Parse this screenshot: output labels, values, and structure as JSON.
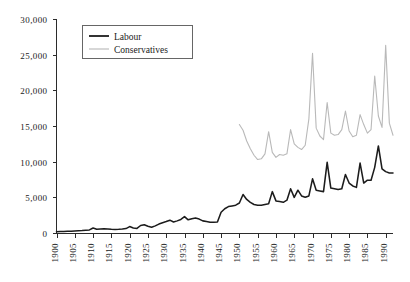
{
  "chart_data": {
    "type": "line",
    "title": "",
    "subtitle": "",
    "xlabel": "",
    "ylabel": "",
    "xlim": [
      1900,
      1992
    ],
    "ylim": [
      0,
      30000
    ],
    "grid": false,
    "legend_position": "top-left-inside",
    "y_ticks": [
      0,
      5000,
      10000,
      15000,
      20000,
      25000,
      30000
    ],
    "y_tick_labels": [
      "0",
      "5,000",
      "10,000",
      "15,000",
      "20,000",
      "25,000",
      "30,000"
    ],
    "x_ticks": [
      1900,
      1905,
      1910,
      1915,
      1920,
      1925,
      1930,
      1935,
      1940,
      1945,
      1950,
      1955,
      1960,
      1965,
      1970,
      1975,
      1980,
      1985,
      1990
    ],
    "x_tick_labels": [
      "1900",
      "1905",
      "1910",
      "1915",
      "1920",
      "1925",
      "1930",
      "1935",
      "1940",
      "1945",
      "1950",
      "1955",
      "1960",
      "1965",
      "1970",
      "1975",
      "1980",
      "1985",
      "1990"
    ],
    "series": [
      {
        "name": "Labour",
        "color": "#1c1c1c",
        "x": [
          1900,
          1901,
          1902,
          1903,
          1904,
          1905,
          1906,
          1907,
          1908,
          1909,
          1910,
          1911,
          1912,
          1913,
          1914,
          1915,
          1916,
          1917,
          1918,
          1919,
          1920,
          1921,
          1922,
          1923,
          1924,
          1925,
          1926,
          1927,
          1928,
          1929,
          1930,
          1931,
          1932,
          1933,
          1934,
          1935,
          1936,
          1937,
          1938,
          1939,
          1940,
          1941,
          1942,
          1943,
          1944,
          1945,
          1946,
          1947,
          1948,
          1949,
          1950,
          1951,
          1952,
          1953,
          1954,
          1955,
          1956,
          1957,
          1958,
          1959,
          1960,
          1961,
          1962,
          1963,
          1964,
          1965,
          1966,
          1967,
          1968,
          1969,
          1970,
          1971,
          1972,
          1973,
          1974,
          1975,
          1976,
          1977,
          1978,
          1979,
          1980,
          1981,
          1982,
          1983,
          1984,
          1985,
          1986,
          1987,
          1988,
          1989,
          1990,
          1991,
          1992
        ],
        "values": [
          180,
          200,
          210,
          240,
          260,
          290,
          320,
          350,
          400,
          430,
          700,
          520,
          560,
          600,
          560,
          520,
          500,
          520,
          560,
          620,
          900,
          700,
          640,
          1050,
          1150,
          950,
          800,
          1000,
          1250,
          1450,
          1600,
          1800,
          1550,
          1700,
          1900,
          2300,
          1850,
          2000,
          2100,
          1950,
          1700,
          1600,
          1500,
          1500,
          1550,
          2900,
          3400,
          3700,
          3800,
          3900,
          4200,
          5400,
          4700,
          4300,
          4000,
          3900,
          3900,
          4000,
          4100,
          5800,
          4500,
          4400,
          4300,
          4600,
          6200,
          5000,
          6000,
          5200,
          5000,
          5200,
          7600,
          6000,
          5900,
          5800,
          9900,
          6300,
          6200,
          6100,
          6200,
          8200,
          7000,
          6600,
          6400,
          9800,
          7000,
          7400,
          7400,
          9200,
          12200,
          9000,
          8600,
          8400,
          8400
        ],
        "highlight_points": [
          {
            "x": 1951,
            "y": 5400,
            "note": "post-war peak"
          },
          {
            "x": 1974,
            "y": 9900,
            "note": "February/October 1974"
          },
          {
            "x": 1989,
            "y": 12200,
            "note": "late-1980s peak"
          }
        ]
      },
      {
        "name": "Conservatives",
        "color": "#b9b9b9",
        "x": [
          1950,
          1951,
          1952,
          1953,
          1954,
          1955,
          1956,
          1957,
          1958,
          1959,
          1960,
          1961,
          1962,
          1963,
          1964,
          1965,
          1966,
          1967,
          1968,
          1969,
          1970,
          1971,
          1972,
          1973,
          1974,
          1975,
          1976,
          1977,
          1978,
          1979,
          1980,
          1981,
          1982,
          1983,
          1984,
          1985,
          1986,
          1987,
          1988,
          1989,
          1990,
          1991,
          1992
        ],
        "values": [
          15200,
          14400,
          12900,
          11800,
          10900,
          10300,
          10400,
          11100,
          14200,
          11300,
          10600,
          11000,
          10900,
          11100,
          14500,
          12500,
          12000,
          11700,
          12300,
          16000,
          25200,
          14700,
          13600,
          13100,
          18300,
          14000,
          13700,
          13800,
          14500,
          17100,
          14300,
          13500,
          13700,
          16600,
          15200,
          14000,
          14500,
          22000,
          16400,
          14800,
          26300,
          15400,
          13700
        ],
        "highlight_points": [
          {
            "x": 1970,
            "y": 25200,
            "note": "1970 peak"
          },
          {
            "x": 1990,
            "y": 26300,
            "note": "1990 peak"
          }
        ]
      }
    ],
    "legend": [
      {
        "label": "Labour",
        "color": "#1c1c1c",
        "style": "solid-dark"
      },
      {
        "label": "Conservatives",
        "color": "#b9b9b9",
        "style": "solid-light"
      }
    ]
  },
  "legend": {
    "labour_label": "Labour",
    "conservatives_label": "Conservatives"
  },
  "colors": {
    "labour": "#1c1c1c",
    "conservatives": "#b9b9b9",
    "axis": "#2b2b2b",
    "background": "#ffffff"
  }
}
